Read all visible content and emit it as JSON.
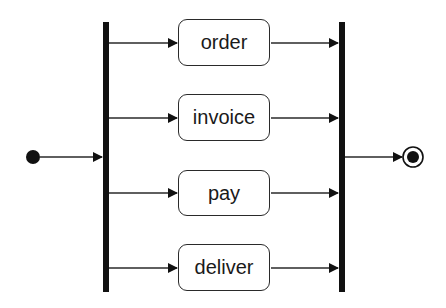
{
  "diagram": {
    "type": "UML activity diagram (fork / join)",
    "initial_node": {
      "name": "initial-node",
      "cx": 33,
      "cy": 157
    },
    "final_node": {
      "name": "final-node",
      "cx": 413,
      "cy": 157
    },
    "fork_bar": {
      "x": 103,
      "y": 22,
      "width": 6,
      "height": 270
    },
    "join_bar": {
      "x": 339,
      "y": 22,
      "width": 6,
      "height": 270
    },
    "actions": [
      {
        "label": "order",
        "x": 178,
        "y": 19,
        "width": 92,
        "height": 47
      },
      {
        "label": "invoice",
        "x": 178,
        "y": 94,
        "width": 92,
        "height": 47
      },
      {
        "label": "pay",
        "x": 178,
        "y": 170,
        "width": 92,
        "height": 46
      },
      {
        "label": "deliver",
        "x": 178,
        "y": 244,
        "width": 92,
        "height": 47
      }
    ],
    "colors": {
      "stroke": "#2a2a2a",
      "bar": "#111111",
      "background": "#ffffff"
    }
  }
}
